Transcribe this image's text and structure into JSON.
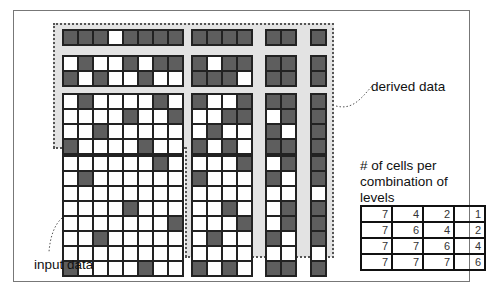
{
  "labels": {
    "derived": "derived data",
    "input": "input data",
    "counts_title_line1": "# of cells per",
    "counts_title_line2": "combination of",
    "counts_title_line3": "levels"
  },
  "colors": {
    "dark_cell": "#5e5e5e",
    "light_cell": "#ffffff",
    "derived_background": "#e3e3e3"
  },
  "grids": {
    "r1_c8": [
      [
        1,
        1,
        1,
        0,
        1,
        1,
        1,
        1
      ]
    ],
    "r1_c4": [
      [
        1,
        1,
        1,
        1
      ]
    ],
    "r1_c2": [
      [
        1,
        1
      ]
    ],
    "r1_c1": [
      [
        1
      ]
    ],
    "r2_c8": [
      [
        0,
        1,
        0,
        0,
        1,
        0,
        1,
        1
      ],
      [
        1,
        0,
        1,
        0,
        0,
        1,
        0,
        0
      ]
    ],
    "r2_c4": [
      [
        1,
        0,
        1,
        1
      ],
      [
        1,
        1,
        1,
        0
      ]
    ],
    "r2_c2": [
      [
        1,
        1
      ],
      [
        1,
        1
      ]
    ],
    "r2_c1": [
      [
        1
      ],
      [
        1
      ]
    ],
    "r4_c8": [
      [
        0,
        1,
        0,
        0,
        0,
        0,
        1,
        0
      ],
      [
        0,
        0,
        0,
        0,
        1,
        0,
        0,
        1
      ],
      [
        0,
        0,
        1,
        0,
        0,
        0,
        0,
        0
      ],
      [
        1,
        0,
        0,
        0,
        0,
        1,
        0,
        0
      ]
    ],
    "r4_c4": [
      [
        1,
        0,
        0,
        1
      ],
      [
        0,
        0,
        1,
        1
      ],
      [
        0,
        1,
        0,
        0
      ],
      [
        1,
        0,
        1,
        0
      ]
    ],
    "r4_c2": [
      [
        1,
        1
      ],
      [
        0,
        1
      ],
      [
        1,
        0
      ],
      [
        1,
        1
      ]
    ],
    "r4_c1": [
      [
        1
      ],
      [
        1
      ],
      [
        1
      ],
      [
        1
      ]
    ],
    "r8_c8": [
      [
        0,
        0,
        0,
        0,
        0,
        0,
        1,
        0
      ],
      [
        0,
        1,
        0,
        0,
        0,
        0,
        0,
        0
      ],
      [
        0,
        0,
        0,
        0,
        0,
        0,
        0,
        0
      ],
      [
        0,
        0,
        0,
        0,
        1,
        0,
        0,
        0
      ],
      [
        0,
        0,
        0,
        0,
        0,
        0,
        0,
        1
      ],
      [
        0,
        0,
        1,
        0,
        0,
        0,
        0,
        0
      ],
      [
        0,
        0,
        0,
        0,
        0,
        0,
        0,
        0
      ],
      [
        1,
        0,
        0,
        0,
        0,
        1,
        0,
        0
      ]
    ],
    "r8_c4": [
      [
        0,
        0,
        0,
        1
      ],
      [
        1,
        0,
        0,
        0
      ],
      [
        0,
        0,
        0,
        0
      ],
      [
        0,
        0,
        1,
        0
      ],
      [
        0,
        0,
        0,
        1
      ],
      [
        0,
        1,
        0,
        0
      ],
      [
        0,
        0,
        0,
        0
      ],
      [
        1,
        0,
        1,
        0
      ]
    ],
    "r8_c2": [
      [
        0,
        1
      ],
      [
        1,
        0
      ],
      [
        0,
        0
      ],
      [
        0,
        1
      ],
      [
        0,
        1
      ],
      [
        1,
        0
      ],
      [
        0,
        0
      ],
      [
        1,
        1
      ]
    ],
    "r8_c1": [
      [
        1
      ],
      [
        1
      ],
      [
        0
      ],
      [
        1
      ],
      [
        1
      ],
      [
        1
      ],
      [
        0
      ],
      [
        1
      ]
    ]
  },
  "counts_table": [
    [
      "7",
      "4",
      "2",
      "1"
    ],
    [
      "7",
      "6",
      "4",
      "2"
    ],
    [
      "7",
      "7",
      "6",
      "4"
    ],
    [
      "7",
      "7",
      "7",
      "6"
    ]
  ]
}
